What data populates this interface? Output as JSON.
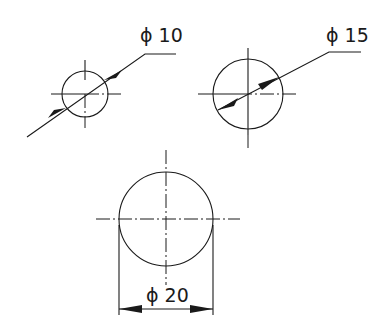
{
  "diagram": {
    "type": "technical-drawing",
    "circles": [
      {
        "id": "small",
        "label": "ϕ 10",
        "diameter": 10,
        "cx": 85,
        "cy": 94,
        "r": 23,
        "style": "leader with arrows outside"
      },
      {
        "id": "medium",
        "label": "ϕ 15",
        "diameter": 15,
        "cx": 248,
        "cy": 94,
        "r": 35,
        "style": "leader with arrows inside"
      },
      {
        "id": "large",
        "label": "ϕ 20",
        "diameter": 20,
        "cx": 166,
        "cy": 219,
        "r": 47,
        "style": "linear dimension with extension lines"
      }
    ]
  }
}
